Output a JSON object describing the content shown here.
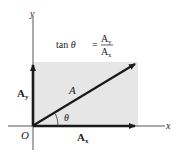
{
  "diagram": {
    "type": "vector-components",
    "colors": {
      "background": "#ffffff",
      "rect_fill": "#e6e6e6",
      "stroke": "#1a1a1a",
      "axis": "#555555"
    },
    "labels": {
      "y_axis": "y",
      "x_axis": "x",
      "origin": "O",
      "vector": "A",
      "angle": "θ",
      "ay_main": "A",
      "ay_sub": "y",
      "ax_main": "A",
      "ax_sub": "x"
    },
    "formula": {
      "lhs": "tan θ",
      "equals": "=",
      "num_main": "A",
      "num_sub": "y",
      "den_main": "A",
      "den_sub": "x"
    }
  }
}
